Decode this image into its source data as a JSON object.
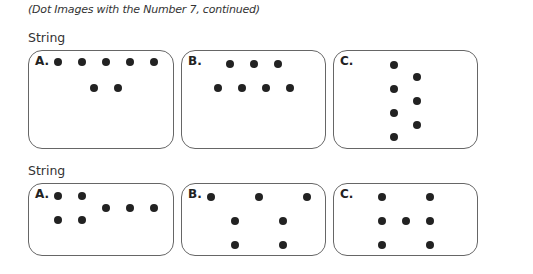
{
  "subtitle": "(Dot Images with the Number 7, continued)",
  "sections": [
    {
      "heading": "String",
      "heading_y": 30,
      "boxes": [
        {
          "label": "A.",
          "x": 28,
          "y": 50,
          "w": 146,
          "h": 99,
          "dots": [
            [
              58,
              62
            ],
            [
              82,
              62
            ],
            [
              106,
              62
            ],
            [
              130,
              62
            ],
            [
              154,
              62
            ],
            [
              94,
              88
            ],
            [
              118,
              88
            ]
          ]
        },
        {
          "label": "B.",
          "x": 181,
          "y": 50,
          "w": 145,
          "h": 99,
          "dots": [
            [
              230,
              64
            ],
            [
              254,
              64
            ],
            [
              278,
              64
            ],
            [
              218,
              88
            ],
            [
              242,
              88
            ],
            [
              266,
              88
            ],
            [
              290,
              88
            ]
          ]
        },
        {
          "label": "C.",
          "x": 333,
          "y": 50,
          "w": 145,
          "h": 99,
          "dots": [
            [
              394,
              65
            ],
            [
              394,
              89
            ],
            [
              394,
              113
            ],
            [
              394,
              137
            ],
            [
              417,
              77
            ],
            [
              417,
              101
            ],
            [
              417,
              125
            ]
          ]
        }
      ]
    },
    {
      "heading": "String",
      "heading_y": 163,
      "boxes": [
        {
          "label": "A.",
          "x": 28,
          "y": 183,
          "w": 146,
          "h": 73,
          "dots": [
            [
              58,
              196
            ],
            [
              82,
              196
            ],
            [
              106,
              208
            ],
            [
              130,
              208
            ],
            [
              154,
              208
            ],
            [
              58,
              220
            ],
            [
              82,
              220
            ]
          ]
        },
        {
          "label": "B.",
          "x": 181,
          "y": 183,
          "w": 145,
          "h": 73,
          "dots": [
            [
              211,
              197
            ],
            [
              259,
              197
            ],
            [
              307,
              197
            ],
            [
              235,
              221
            ],
            [
              283,
              221
            ],
            [
              235,
              245
            ],
            [
              283,
              245
            ]
          ]
        },
        {
          "label": "C.",
          "x": 333,
          "y": 183,
          "w": 145,
          "h": 73,
          "dots": [
            [
              382,
              197
            ],
            [
              430,
              197
            ],
            [
              382,
              221
            ],
            [
              406,
              221
            ],
            [
              430,
              221
            ],
            [
              382,
              245
            ],
            [
              430,
              245
            ]
          ]
        }
      ]
    }
  ]
}
